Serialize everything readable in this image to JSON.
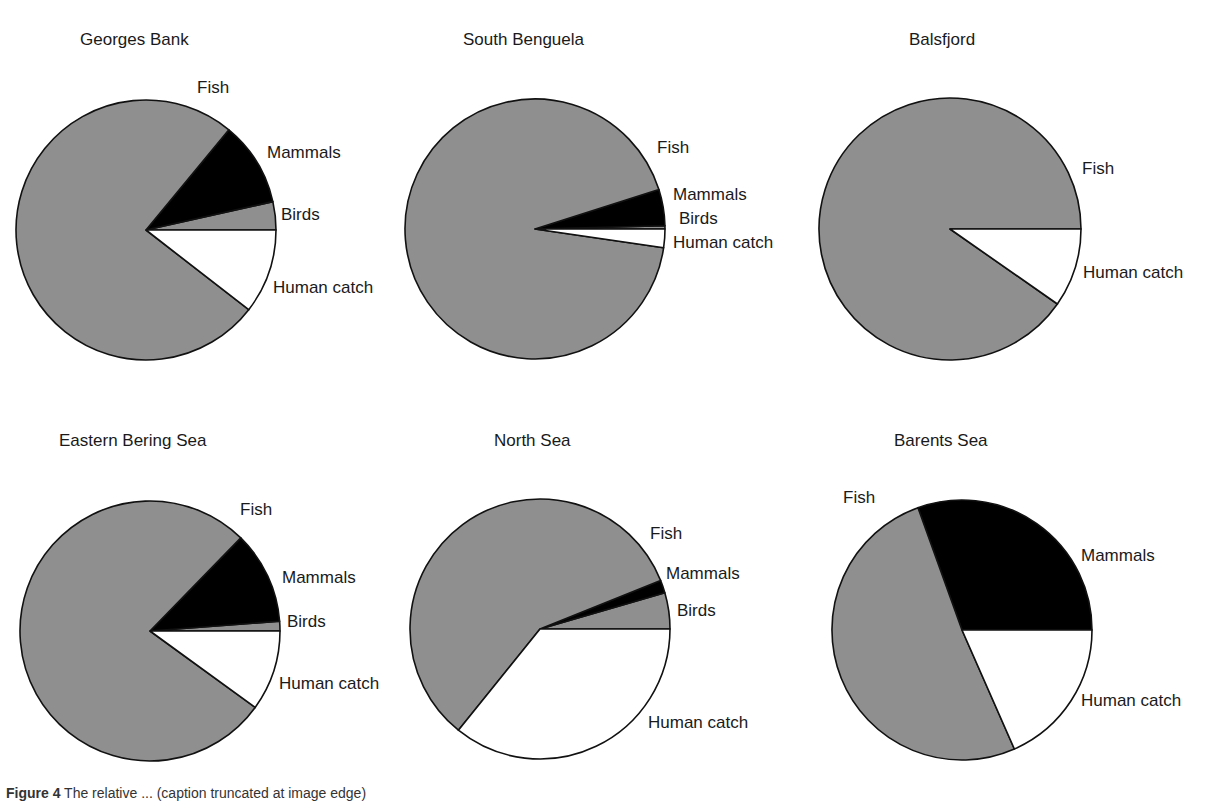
{
  "colors": {
    "fish": "#8f8f8f",
    "mammals": "#000000",
    "birds": "#8f8f8f",
    "human_catch": "#ffffff",
    "stroke": "#111111"
  },
  "caption": {
    "label": "Figure 4",
    "text": "The relative ... (caption truncated at image edge)"
  },
  "chart_data": [
    {
      "type": "pie",
      "title": "Georges Bank",
      "categories": [
        "Fish",
        "Mammals",
        "Birds",
        "Human catch"
      ],
      "values": [
        75.5,
        10.5,
        3.5,
        10.5
      ],
      "unit": "% (estimated from slice angles)"
    },
    {
      "type": "pie",
      "title": "South Benguela",
      "categories": [
        "Fish",
        "Mammals",
        "Birds",
        "Human catch"
      ],
      "values": [
        92.8,
        4.5,
        0.4,
        2.3
      ],
      "unit": "% (estimated from slice angles)"
    },
    {
      "type": "pie",
      "title": "Balsfjord",
      "categories": [
        "Fish",
        "Human catch"
      ],
      "values": [
        90.3,
        9.7
      ],
      "unit": "% (estimated from slice angles)"
    },
    {
      "type": "pie",
      "title": "Eastern Bering Sea",
      "categories": [
        "Fish",
        "Mammals",
        "Birds",
        "Human catch"
      ],
      "values": [
        77.3,
        11.5,
        1.2,
        10.0
      ],
      "unit": "% (estimated from slice angles)"
    },
    {
      "type": "pie",
      "title": "North Sea",
      "categories": [
        "Fish",
        "Mammals",
        "Birds",
        "Human catch"
      ],
      "values": [
        58.1,
        1.6,
        4.5,
        35.8
      ],
      "unit": "% (estimated from slice angles)"
    },
    {
      "type": "pie",
      "title": "Barents Sea",
      "categories": [
        "Fish",
        "Mammals",
        "Human catch"
      ],
      "values": [
        51.1,
        30.5,
        18.4
      ],
      "unit": "% (estimated from slice angles)"
    }
  ],
  "panels": [
    {
      "title": "Georges Bank",
      "labels": {
        "fish": "Fish",
        "mammals": "Mammals",
        "birds": "Birds",
        "human": "Human catch"
      }
    },
    {
      "title": "South Benguela",
      "labels": {
        "fish": "Fish",
        "mammals": "Mammals",
        "birds": "Birds",
        "human": "Human catch"
      }
    },
    {
      "title": "Balsfjord",
      "labels": {
        "fish": "Fish",
        "human": "Human catch"
      }
    },
    {
      "title": "Eastern Bering Sea",
      "labels": {
        "fish": "Fish",
        "mammals": "Mammals",
        "birds": "Birds",
        "human": "Human catch"
      }
    },
    {
      "title": "North Sea",
      "labels": {
        "fish": "Fish",
        "mammals": "Mammals",
        "birds": "Birds",
        "human": "Human catch"
      }
    },
    {
      "title": "Barents Sea",
      "labels": {
        "fish": "Fish",
        "mammals": "Mammals",
        "human": "Human catch"
      }
    }
  ]
}
